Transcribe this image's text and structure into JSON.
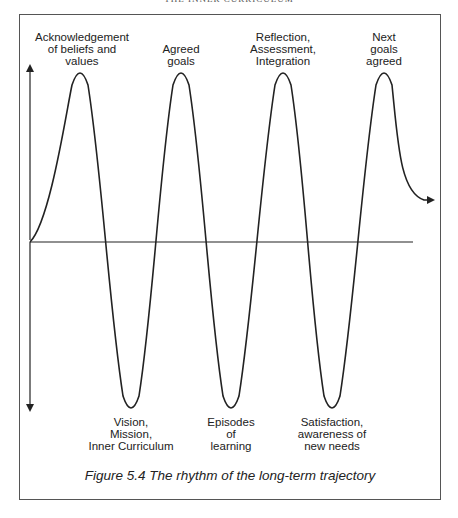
{
  "running_header": "THE INNER CURRICULUM",
  "figure": {
    "caption": "Figure 5.4 The rhythm of the long-term trajectory",
    "axes": {
      "vertical": {
        "x": 30,
        "y_top": 63,
        "y_bottom": 413,
        "arrows": "both"
      },
      "horizontal": {
        "y": 242,
        "x_start": 30,
        "x_end": 413
      }
    },
    "wave": {
      "stroke": "#222222",
      "peaks_x": [
        80,
        181,
        283,
        384
      ],
      "troughs_x": [
        131,
        231,
        332
      ],
      "peak_y": 73,
      "trough_y": 408,
      "end_arrow": {
        "x": 437,
        "y": 200
      }
    },
    "peak_labels": [
      {
        "text": "Acknowledgement\nof beliefs and\nvalues",
        "x": 82
      },
      {
        "text": "Agreed\ngoals",
        "x": 181
      },
      {
        "text": "Reflection,\nAssessment,\nIntegration",
        "x": 283
      },
      {
        "text": "Next\ngoals\nagreed",
        "x": 384
      }
    ],
    "trough_labels": [
      {
        "text": "Vision,\nMission,\nInner Curriculum",
        "x": 131
      },
      {
        "text": "Episodes\nof\nlearning",
        "x": 231
      },
      {
        "text": "Satisfaction,\nawareness of\nnew needs",
        "x": 332
      }
    ]
  }
}
